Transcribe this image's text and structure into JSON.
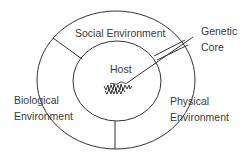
{
  "diagram": {
    "type": "nested-ellipse",
    "labels": {
      "social": "Social Environment",
      "host": "Host",
      "genetic_line1": "Genetic",
      "genetic_line2": "Core",
      "biological_line1": "Biological",
      "biological_line2": "Environment",
      "physical_line1": "Physical",
      "physical_line2": "Environment"
    },
    "colors": {
      "stroke": "#333333",
      "text": "#3a3a3a",
      "background": "#ffffff"
    }
  }
}
